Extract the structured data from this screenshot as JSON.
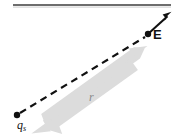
{
  "figure": {
    "background_color": "#ffffff",
    "top_rule": {
      "name": "top-rule",
      "x1": 13,
      "y1": 5,
      "x2": 171,
      "y2": 5,
      "color": "#3d3d3d",
      "width": 1.6
    },
    "labels": {
      "field_vector": "E",
      "source_charge": "q",
      "source_charge_subscript": "s",
      "distance": "r"
    },
    "colors": {
      "ink": "#111111",
      "rule": "#3d3d3d",
      "gray_arrow": "#dcdcdc",
      "gray_label": "#8a8a8a"
    },
    "points": {
      "source_charge": {
        "x": 17,
        "y": 115,
        "radius": 3.1,
        "color": "#111111"
      },
      "field_point": {
        "x": 148,
        "y": 34,
        "radius": 3.1,
        "color": "#111111"
      }
    },
    "dashed_line": {
      "name": "radial-dashed-line",
      "x1": 19,
      "y1": 114,
      "x2": 146,
      "y2": 36,
      "color": "#111111",
      "width": 2.1,
      "dash": "7 5"
    },
    "field_arrow": {
      "name": "electric-field-vector",
      "x1": 148,
      "y1": 34,
      "x2": 170,
      "y2": 13,
      "color": "#111111",
      "width": 2.0
    },
    "distance_arrow": {
      "name": "distance-double-arrow",
      "x1": 36,
      "y1": 128,
      "x2": 145,
      "y2": 50,
      "color": "#dcdcdc",
      "shaft_width": 9,
      "head_width": 22,
      "head_length": 18,
      "double_headed": true
    }
  }
}
